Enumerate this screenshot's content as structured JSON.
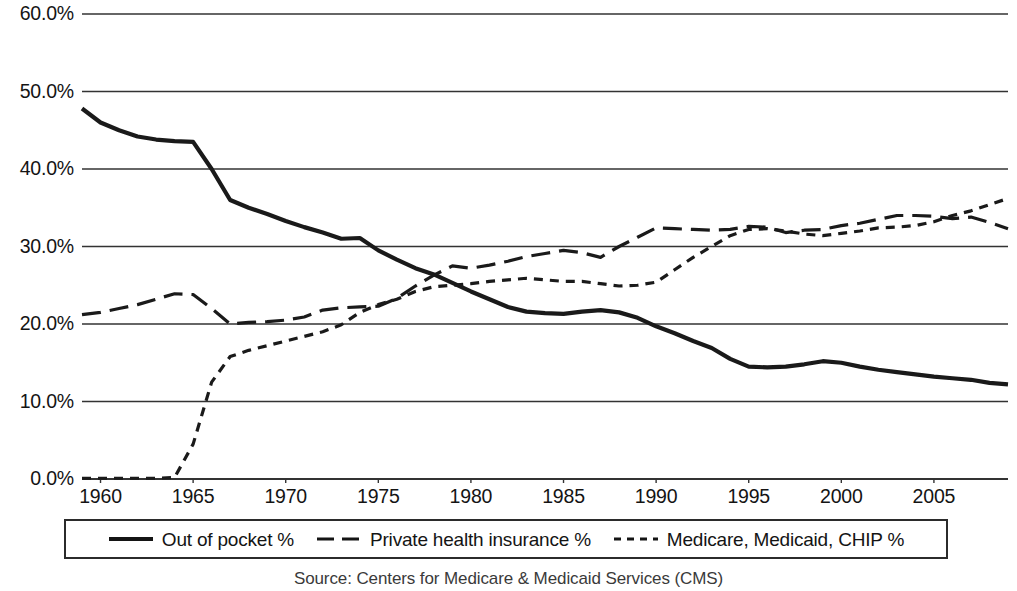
{
  "chart_data": {
    "type": "line",
    "title": "",
    "subtitle": "",
    "xlabel": "",
    "ylabel": "",
    "source": "Source: Centers for Medicare & Medicaid Services (CMS)",
    "grid": true,
    "legend_position": "bottom",
    "xlim": [
      1959,
      2009
    ],
    "ylim": [
      0,
      60
    ],
    "y_ticks": [
      0,
      10,
      20,
      30,
      40,
      50,
      60
    ],
    "y_tick_labels": [
      "0.0%",
      "10.0%",
      "20.0%",
      "30.0%",
      "40.0%",
      "50.0%",
      "60.0%"
    ],
    "x_ticks": [
      1960,
      1965,
      1970,
      1975,
      1980,
      1985,
      1990,
      1995,
      2000,
      2005
    ],
    "x_tick_labels": [
      "1960",
      "1965",
      "1970",
      "1975",
      "1980",
      "1985",
      "1990",
      "1995",
      "2000",
      "2005"
    ],
    "x": [
      1959,
      1960,
      1961,
      1962,
      1963,
      1964,
      1965,
      1966,
      1967,
      1968,
      1969,
      1970,
      1971,
      1972,
      1973,
      1974,
      1975,
      1976,
      1977,
      1978,
      1979,
      1980,
      1981,
      1982,
      1983,
      1984,
      1985,
      1986,
      1987,
      1988,
      1989,
      1990,
      1991,
      1992,
      1993,
      1994,
      1995,
      1996,
      1997,
      1998,
      1999,
      2000,
      2001,
      2002,
      2003,
      2004,
      2005,
      2006,
      2007,
      2008,
      2009
    ],
    "series": [
      {
        "name": "Out of pocket %",
        "style": "solid",
        "color": "#1a1a1a",
        "values": [
          47.8,
          46.0,
          45.0,
          44.2,
          43.8,
          43.6,
          43.5,
          40.0,
          36.0,
          35.0,
          34.2,
          33.3,
          32.5,
          31.8,
          31.0,
          31.1,
          29.5,
          28.3,
          27.2,
          26.4,
          25.3,
          24.2,
          23.2,
          22.2,
          21.6,
          21.4,
          21.3,
          21.6,
          21.8,
          21.5,
          20.8,
          19.7,
          18.8,
          17.8,
          16.9,
          15.5,
          14.5,
          14.4,
          14.5,
          14.8,
          15.2,
          15.0,
          14.5,
          14.1,
          13.8,
          13.5,
          13.2,
          13.0,
          12.8,
          12.4,
          12.2
        ]
      },
      {
        "name": "Private health insurance %",
        "style": "dashed-long",
        "color": "#1a1a1a",
        "values": [
          21.2,
          21.5,
          22.0,
          22.5,
          23.2,
          23.9,
          23.8,
          22.0,
          20.0,
          20.2,
          20.3,
          20.5,
          20.9,
          21.8,
          22.1,
          22.2,
          22.3,
          23.3,
          24.9,
          26.3,
          27.5,
          27.2,
          27.6,
          28.1,
          28.7,
          29.1,
          29.5,
          29.2,
          28.6,
          30.0,
          31.2,
          32.4,
          32.3,
          32.2,
          32.1,
          32.2,
          32.6,
          32.5,
          31.8,
          32.1,
          32.2,
          32.7,
          33.0,
          33.5,
          34.0,
          34.0,
          33.9,
          33.6,
          33.8,
          33.1,
          32.3
        ]
      },
      {
        "name": "Medicare, Medicaid, CHIP %",
        "style": "dashed-short",
        "color": "#1a1a1a",
        "values": [
          0.1,
          0.1,
          0.1,
          0.1,
          0.1,
          0.2,
          4.5,
          12.5,
          15.8,
          16.6,
          17.2,
          17.8,
          18.4,
          19.0,
          19.9,
          21.5,
          22.5,
          23.2,
          24.2,
          24.8,
          25.0,
          25.2,
          25.5,
          25.7,
          25.9,
          25.7,
          25.5,
          25.5,
          25.2,
          24.9,
          25.0,
          25.4,
          27.0,
          28.6,
          30.0,
          31.4,
          32.2,
          32.3,
          32.0,
          31.6,
          31.4,
          31.7,
          32.0,
          32.4,
          32.5,
          32.7,
          33.2,
          34.0,
          34.6,
          35.4,
          36.2
        ]
      }
    ]
  },
  "legend": {
    "items": [
      {
        "label": "Out of pocket %",
        "style": "solid"
      },
      {
        "label": "Private health insurance %",
        "style": "dashed-long"
      },
      {
        "label": "Medicare, Medicaid, CHIP %",
        "style": "dashed-short"
      }
    ]
  },
  "caption": {
    "source": "Source: Centers for Medicare & Medicaid Services (CMS)"
  }
}
